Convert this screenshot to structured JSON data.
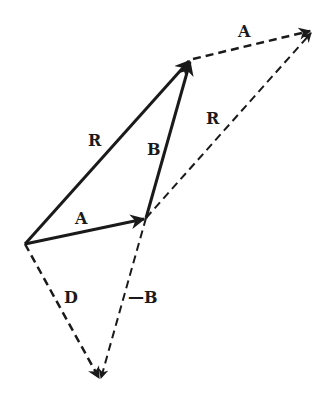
{
  "diagram": {
    "type": "vector-addition-subtraction",
    "points": {
      "O": [
        25,
        244
      ],
      "A_tip": [
        146,
        218
      ],
      "R_tip": [
        191,
        59
      ],
      "R2_tip": [
        313,
        30
      ],
      "D_tip": [
        100,
        381
      ]
    },
    "vectors": [
      {
        "id": "R",
        "from": "O",
        "to": "R_tip",
        "style": "solid",
        "label": "R"
      },
      {
        "id": "A",
        "from": "O",
        "to": "A_tip",
        "style": "solid",
        "label": "A"
      },
      {
        "id": "B",
        "from": "A_tip",
        "to": "R_tip",
        "style": "solid",
        "label": "B"
      },
      {
        "id": "A2",
        "from": "R_tip",
        "to": "R2_tip",
        "style": "dashed",
        "label": "A"
      },
      {
        "id": "R2",
        "from": "A_tip",
        "to": "R2_tip",
        "style": "dashed",
        "label": "R"
      },
      {
        "id": "D",
        "from": "O",
        "to": "D_tip",
        "style": "dashed",
        "label": "D"
      },
      {
        "id": "negB",
        "from": "A_tip",
        "to": "D_tip",
        "style": "dashed",
        "label": "—B"
      }
    ],
    "labels": {
      "R_left": "R",
      "A_bottom": "A",
      "B_mid": "B",
      "A_top": "A",
      "R_right": "R",
      "D": "D",
      "neg_B": "—B"
    },
    "colors": {
      "stroke": "#1a1a1a",
      "background": "#ffffff"
    }
  }
}
